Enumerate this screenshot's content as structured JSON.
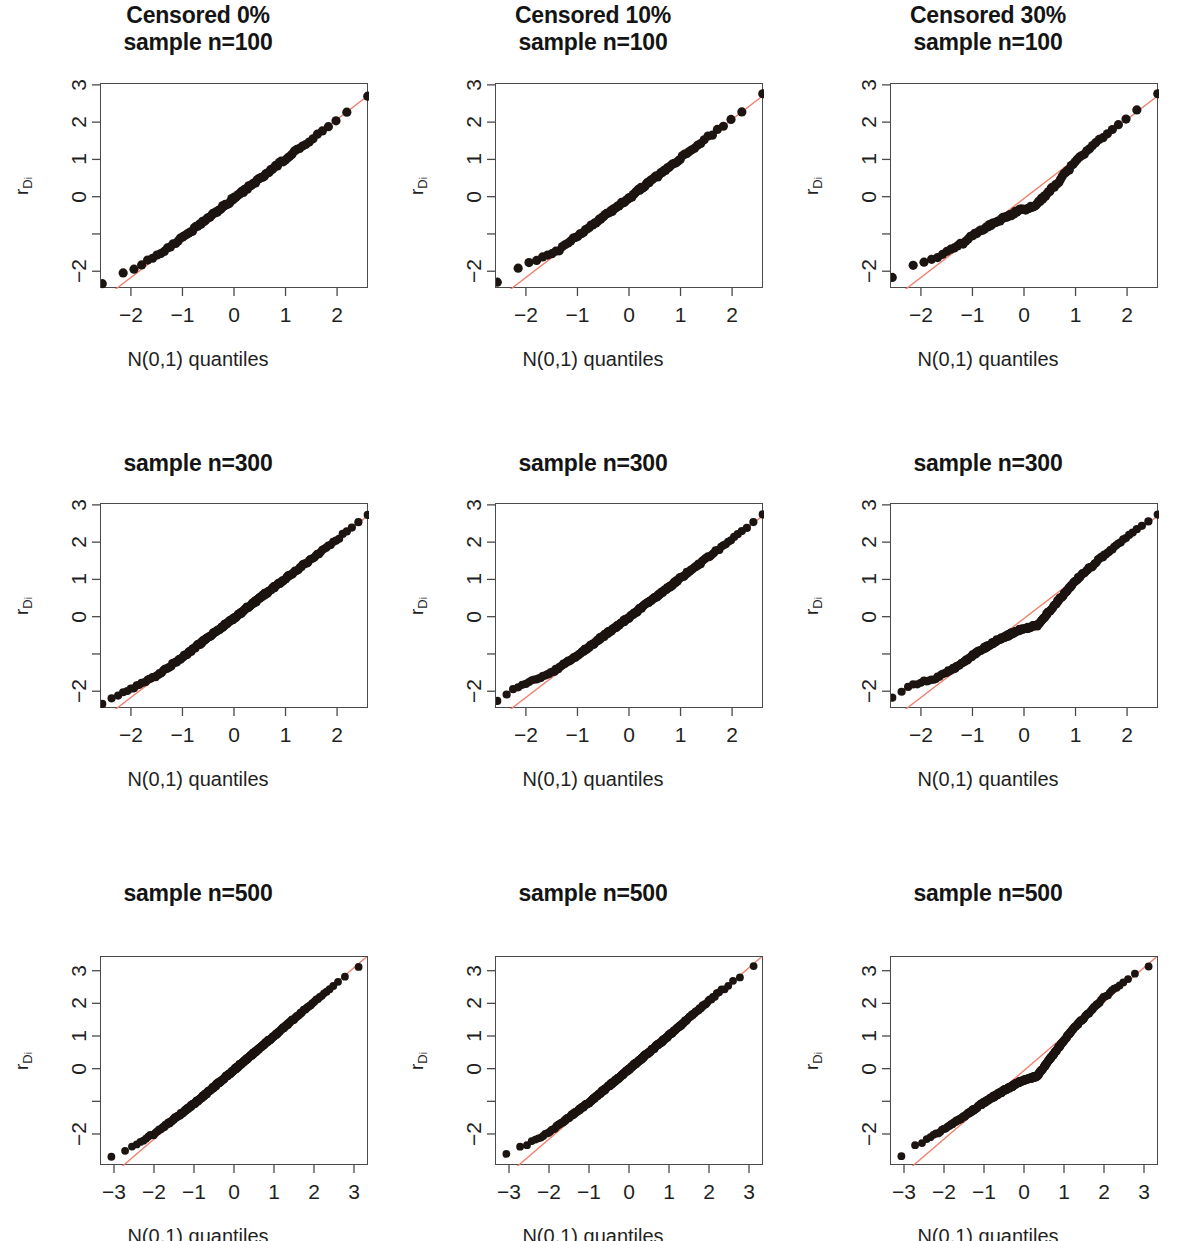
{
  "figure": {
    "type": "qq-plot-grid",
    "rows": 3,
    "cols": 3,
    "background": "#ffffff",
    "point_color": "#1c1410",
    "line_color": "#f08070",
    "axis_color": "#4a4a4a"
  },
  "labels": {
    "xlab": "N(0,1) quantiles",
    "ylab_main": "r",
    "ylab_sub": "D",
    "ylab_sub2": "i"
  },
  "panels": [
    {
      "id": "p00",
      "title": "Censored 0%\nsample n=100",
      "censored": "0%",
      "n": 100,
      "title_lines": 2
    },
    {
      "id": "p01",
      "title": "Censored 10%\nsample n=100",
      "censored": "10%",
      "n": 100,
      "title_lines": 2
    },
    {
      "id": "p02",
      "title": "Censored 30%\nsample n=100",
      "censored": "30%",
      "n": 100,
      "title_lines": 2
    },
    {
      "id": "p10",
      "title": "sample n=300",
      "censored": "0%",
      "n": 300,
      "title_lines": 1
    },
    {
      "id": "p11",
      "title": "sample n=300",
      "censored": "10%",
      "n": 300,
      "title_lines": 1
    },
    {
      "id": "p12",
      "title": "sample n=300",
      "censored": "30%",
      "n": 300,
      "title_lines": 1
    },
    {
      "id": "p20",
      "title": "sample n=500",
      "censored": "0%",
      "n": 500,
      "title_lines": 1
    },
    {
      "id": "p21",
      "title": "sample n=500",
      "censored": "10%",
      "n": 500,
      "title_lines": 1
    },
    {
      "id": "p22",
      "title": "sample n=500",
      "censored": "30%",
      "n": 500,
      "title_lines": 1
    }
  ],
  "chart_data": [
    {
      "id": "p00",
      "type": "scatter",
      "title": "Censored 0% sample n=100",
      "xlabel": "N(0,1) quantiles",
      "ylabel": "r_Di",
      "xlim": [
        -2.6,
        2.6
      ],
      "ylim": [
        -2.45,
        3.05
      ],
      "xticks": [
        -2,
        -1,
        0,
        1,
        2
      ],
      "xtick_labels": [
        "−2",
        "−1",
        "0",
        "1",
        "2"
      ],
      "yticks": [
        -2,
        -1,
        0,
        1,
        2,
        3
      ],
      "ytick_labels": [
        "−2",
        "",
        "0",
        "1",
        "2",
        "3"
      ],
      "grid": false,
      "legend": null,
      "n_points": 100,
      "reference_line": {
        "intercept": 0.0,
        "slope": 1.06,
        "color": "#f08070"
      },
      "curve_shape": "linear",
      "deviation": [
        [
          -2.6,
          -2.35
        ],
        [
          -2.0,
          -1.92
        ],
        [
          -1.5,
          -1.55
        ],
        [
          -1.0,
          -1.05
        ],
        [
          -0.5,
          -0.52
        ],
        [
          0.0,
          0.0
        ],
        [
          0.5,
          0.53
        ],
        [
          1.0,
          1.06
        ],
        [
          1.5,
          1.58
        ],
        [
          2.0,
          2.12
        ],
        [
          2.6,
          2.78
        ]
      ]
    },
    {
      "id": "p01",
      "type": "scatter",
      "title": "Censored 10% sample n=100",
      "xlabel": "N(0,1) quantiles",
      "ylabel": "r_Di",
      "xlim": [
        -2.6,
        2.6
      ],
      "ylim": [
        -2.45,
        3.05
      ],
      "xticks": [
        -2,
        -1,
        0,
        1,
        2
      ],
      "xtick_labels": [
        "−2",
        "−1",
        "0",
        "1",
        "2"
      ],
      "yticks": [
        -2,
        -1,
        0,
        1,
        2,
        3
      ],
      "ytick_labels": [
        "−2",
        "",
        "0",
        "1",
        "2",
        "3"
      ],
      "grid": false,
      "legend": null,
      "n_points": 100,
      "reference_line": {
        "intercept": 0.0,
        "slope": 1.06,
        "color": "#f08070"
      },
      "curve_shape": "slight-convex-lower-tail",
      "deviation": [
        [
          -2.6,
          -2.32
        ],
        [
          -2.2,
          -1.88
        ],
        [
          -1.8,
          -1.68
        ],
        [
          -1.4,
          -1.42
        ],
        [
          -1.0,
          -1.0
        ],
        [
          -0.5,
          -0.49
        ],
        [
          0.0,
          0.02
        ],
        [
          0.5,
          0.55
        ],
        [
          1.0,
          1.08
        ],
        [
          1.5,
          1.6
        ],
        [
          2.0,
          2.12
        ],
        [
          2.6,
          2.78
        ]
      ]
    },
    {
      "id": "p02",
      "type": "scatter",
      "title": "Censored 30% sample n=100",
      "xlabel": "N(0,1) quantiles",
      "ylabel": "r_Di",
      "xlim": [
        -2.6,
        2.6
      ],
      "ylim": [
        -2.45,
        3.05
      ],
      "xticks": [
        -2,
        -1,
        0,
        1,
        2
      ],
      "xtick_labels": [
        "−2",
        "−1",
        "0",
        "1",
        "2"
      ],
      "yticks": [
        -2,
        -1,
        0,
        1,
        2,
        3
      ],
      "ytick_labels": [
        "−2",
        "",
        "0",
        "1",
        "2",
        "3"
      ],
      "grid": false,
      "legend": null,
      "n_points": 100,
      "reference_line": {
        "intercept": 0.0,
        "slope": 1.06,
        "color": "#f08070"
      },
      "curve_shape": "s-shaped-plateau-near-zero",
      "deviation": [
        [
          -2.55,
          -2.12
        ],
        [
          -2.2,
          -1.82
        ],
        [
          -1.95,
          -1.72
        ],
        [
          -1.7,
          -1.62
        ],
        [
          -1.3,
          -1.3
        ],
        [
          -0.9,
          -0.92
        ],
        [
          -0.5,
          -0.6
        ],
        [
          -0.1,
          -0.34
        ],
        [
          0.2,
          -0.22
        ],
        [
          0.6,
          0.35
        ],
        [
          1.0,
          1.0
        ],
        [
          1.5,
          1.62
        ],
        [
          2.0,
          2.18
        ],
        [
          2.3,
          2.45
        ],
        [
          2.6,
          2.8
        ]
      ]
    },
    {
      "id": "p10",
      "type": "scatter",
      "title": "sample n=300 (Censored 0%)",
      "xlabel": "N(0,1) quantiles",
      "ylabel": "r_Di",
      "xlim": [
        -2.6,
        2.6
      ],
      "ylim": [
        -2.45,
        3.05
      ],
      "xticks": [
        -2,
        -1,
        0,
        1,
        2
      ],
      "xtick_labels": [
        "−2",
        "−1",
        "0",
        "1",
        "2"
      ],
      "yticks": [
        -2,
        -1,
        0,
        1,
        2,
        3
      ],
      "ytick_labels": [
        "−2",
        "",
        "0",
        "1",
        "2",
        "3"
      ],
      "grid": false,
      "legend": null,
      "n_points": 300,
      "reference_line": {
        "intercept": 0.0,
        "slope": 1.06,
        "color": "#f08070"
      },
      "curve_shape": "linear",
      "deviation": [
        [
          -2.6,
          -2.35
        ],
        [
          -2.0,
          -1.9
        ],
        [
          -1.5,
          -1.54
        ],
        [
          -1.0,
          -1.04
        ],
        [
          -0.5,
          -0.51
        ],
        [
          0.0,
          0.01
        ],
        [
          0.5,
          0.54
        ],
        [
          1.0,
          1.07
        ],
        [
          1.5,
          1.59
        ],
        [
          2.0,
          2.12
        ],
        [
          2.6,
          2.8
        ]
      ]
    },
    {
      "id": "p11",
      "type": "scatter",
      "title": "sample n=300 (Censored 10%)",
      "xlabel": "N(0,1) quantiles",
      "ylabel": "r_Di",
      "xlim": [
        -2.6,
        2.6
      ],
      "ylim": [
        -2.45,
        3.05
      ],
      "xticks": [
        -2,
        -1,
        0,
        1,
        2
      ],
      "xtick_labels": [
        "−2",
        "−1",
        "0",
        "1",
        "2"
      ],
      "yticks": [
        -2,
        -1,
        0,
        1,
        2,
        3
      ],
      "ytick_labels": [
        "−2",
        "",
        "0",
        "1",
        "2",
        "3"
      ],
      "grid": false,
      "legend": null,
      "n_points": 300,
      "reference_line": {
        "intercept": 0.0,
        "slope": 1.06,
        "color": "#f08070"
      },
      "curve_shape": "slight-convex-lower-tail",
      "deviation": [
        [
          -2.6,
          -2.3
        ],
        [
          -2.25,
          -1.92
        ],
        [
          -1.9,
          -1.7
        ],
        [
          -1.5,
          -1.46
        ],
        [
          -1.0,
          -1.0
        ],
        [
          -0.5,
          -0.48
        ],
        [
          0.0,
          0.03
        ],
        [
          0.5,
          0.56
        ],
        [
          1.0,
          1.08
        ],
        [
          1.5,
          1.6
        ],
        [
          2.0,
          2.14
        ],
        [
          2.6,
          2.8
        ]
      ]
    },
    {
      "id": "p12",
      "type": "scatter",
      "title": "sample n=300 (Censored 30%)",
      "xlabel": "N(0,1) quantiles",
      "ylabel": "r_Di",
      "xlim": [
        -2.6,
        2.6
      ],
      "ylim": [
        -2.45,
        3.05
      ],
      "xticks": [
        -2,
        -1,
        0,
        1,
        2
      ],
      "xtick_labels": [
        "−2",
        "−1",
        "0",
        "1",
        "2"
      ],
      "yticks": [
        -2,
        -1,
        0,
        1,
        2,
        3
      ],
      "ytick_labels": [
        "−2",
        "",
        "0",
        "1",
        "2",
        "3"
      ],
      "grid": false,
      "legend": null,
      "n_points": 300,
      "reference_line": {
        "intercept": 0.0,
        "slope": 1.06,
        "color": "#f08070"
      },
      "curve_shape": "s-shaped-plateau-near-zero",
      "deviation": [
        [
          -2.55,
          -2.13
        ],
        [
          -2.25,
          -1.83
        ],
        [
          -2.0,
          -1.73
        ],
        [
          -1.7,
          -1.6
        ],
        [
          -1.3,
          -1.3
        ],
        [
          -0.9,
          -0.9
        ],
        [
          -0.5,
          -0.58
        ],
        [
          -0.1,
          -0.33
        ],
        [
          0.25,
          -0.2
        ],
        [
          0.6,
          0.38
        ],
        [
          1.0,
          1.02
        ],
        [
          1.5,
          1.64
        ],
        [
          2.0,
          2.2
        ],
        [
          2.3,
          2.46
        ],
        [
          2.6,
          2.82
        ]
      ]
    },
    {
      "id": "p20",
      "type": "scatter",
      "title": "sample n=500 (Censored 0%)",
      "xlabel": "N(0,1) quantiles",
      "ylabel": "r_Di",
      "xlim": [
        -3.35,
        3.35
      ],
      "ylim": [
        -2.95,
        3.45
      ],
      "xticks": [
        -3,
        -2,
        -1,
        0,
        1,
        2,
        3
      ],
      "xtick_labels": [
        "−3",
        "−2",
        "−1",
        "0",
        "1",
        "2",
        "3"
      ],
      "yticks": [
        -2,
        -1,
        0,
        1,
        2,
        3
      ],
      "ytick_labels": [
        "−2",
        "",
        "0",
        "1",
        "2",
        "3"
      ],
      "grid": false,
      "legend": null,
      "n_points": 500,
      "reference_line": {
        "intercept": 0.0,
        "slope": 1.05,
        "color": "#f08070"
      },
      "curve_shape": "linear",
      "deviation": [
        [
          -3.2,
          -2.72
        ],
        [
          -2.8,
          -2.5
        ],
        [
          -2.0,
          -1.95
        ],
        [
          -1.0,
          -1.02
        ],
        [
          0.0,
          0.02
        ],
        [
          1.0,
          1.06
        ],
        [
          2.0,
          2.1
        ],
        [
          2.9,
          3.0
        ],
        [
          3.15,
          3.2
        ]
      ]
    },
    {
      "id": "p21",
      "type": "scatter",
      "title": "sample n=500 (Censored 10%)",
      "xlabel": "N(0,1) quantiles",
      "ylabel": "r_Di",
      "xlim": [
        -3.35,
        3.35
      ],
      "ylim": [
        -2.95,
        3.45
      ],
      "xticks": [
        -3,
        -2,
        -1,
        0,
        1,
        2,
        3
      ],
      "xtick_labels": [
        "−3",
        "−2",
        "−1",
        "0",
        "1",
        "2",
        "3"
      ],
      "yticks": [
        -2,
        -1,
        0,
        1,
        2,
        3
      ],
      "ytick_labels": [
        "−2",
        "",
        "0",
        "1",
        "2",
        "3"
      ],
      "grid": false,
      "legend": null,
      "n_points": 500,
      "reference_line": {
        "intercept": 0.0,
        "slope": 1.05,
        "color": "#f08070"
      },
      "curve_shape": "slight-convex-lower-tail",
      "deviation": [
        [
          -3.2,
          -2.68
        ],
        [
          -2.85,
          -2.42
        ],
        [
          -2.5,
          -2.25
        ],
        [
          -2.0,
          -1.88
        ],
        [
          -1.0,
          -0.98
        ],
        [
          0.0,
          0.04
        ],
        [
          1.0,
          1.08
        ],
        [
          2.0,
          2.14
        ],
        [
          2.9,
          3.0
        ],
        [
          3.15,
          3.2
        ]
      ]
    },
    {
      "id": "p22",
      "type": "scatter",
      "title": "sample n=500 (Censored 30%)",
      "xlabel": "N(0,1) quantiles",
      "ylabel": "r_Di",
      "xlim": [
        -3.35,
        3.35
      ],
      "ylim": [
        -2.95,
        3.45
      ],
      "xticks": [
        -3,
        -2,
        -1,
        0,
        1,
        2,
        3
      ],
      "xtick_labels": [
        "−3",
        "−2",
        "−1",
        "0",
        "1",
        "2",
        "3"
      ],
      "yticks": [
        -2,
        -1,
        0,
        1,
        2,
        3
      ],
      "ytick_labels": [
        "−2",
        "",
        "0",
        "1",
        "2",
        "3"
      ],
      "grid": false,
      "legend": null,
      "n_points": 500,
      "reference_line": {
        "intercept": 0.0,
        "slope": 1.05,
        "color": "#f08070"
      },
      "curve_shape": "s-shaped-plateau-near-zero",
      "deviation": [
        [
          -3.15,
          -2.72
        ],
        [
          -2.9,
          -2.4
        ],
        [
          -2.6,
          -2.25
        ],
        [
          -2.2,
          -1.95
        ],
        [
          -1.6,
          -1.5
        ],
        [
          -1.0,
          -0.98
        ],
        [
          -0.5,
          -0.62
        ],
        [
          -0.1,
          -0.35
        ],
        [
          0.3,
          -0.2
        ],
        [
          0.7,
          0.45
        ],
        [
          1.2,
          1.25
        ],
        [
          2.0,
          2.25
        ],
        [
          2.7,
          2.9
        ],
        [
          3.0,
          3.05
        ],
        [
          3.2,
          3.22
        ]
      ]
    }
  ]
}
